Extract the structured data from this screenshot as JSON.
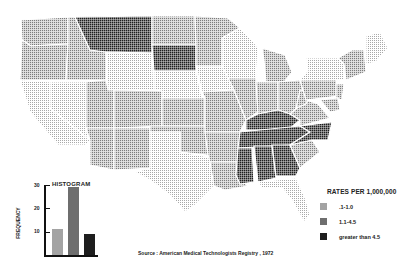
{
  "map": {
    "title": "Rates per 1,000,000 (American Medical Technologists Registry, 1972)",
    "categories": [
      {
        "key": "low",
        "label": ".1-1.0",
        "color": "#bdbdbd"
      },
      {
        "key": "mid",
        "label": "1.1-4.5",
        "color": "#8a8a8a"
      },
      {
        "key": "high",
        "label": "greater than 4.5",
        "color": "#2a2a2a"
      }
    ],
    "states_high": [
      "Montana",
      "South Dakota",
      "Kentucky",
      "Tennessee",
      "Mississippi",
      "Alabama",
      "Georgia"
    ],
    "states_low": [
      "Nevada",
      "California",
      "Arizona",
      "New Mexico",
      "Texas",
      "Wyoming",
      "Wisconsin",
      "Maine",
      "Louisiana",
      "Florida",
      "Minnesota"
    ]
  },
  "histogram": {
    "title": "HISTOGRAM",
    "ylabel": "FREQUENCY",
    "yticks": [
      "30",
      "20",
      "10"
    ],
    "bars": [
      {
        "category": ".1-1.0",
        "value": 11
      },
      {
        "category": "1.1-4.5",
        "value": 29
      },
      {
        "category": "greater than 4.5",
        "value": 9
      }
    ]
  },
  "legend": {
    "title": "RATES PER 1,000,000",
    "items": [
      {
        "label": ".1-1.0"
      },
      {
        "label": "1.1-4.5"
      },
      {
        "label": "greater than 4.5"
      }
    ]
  },
  "source": "Source : American Medical Technologists Registry , 1972"
}
